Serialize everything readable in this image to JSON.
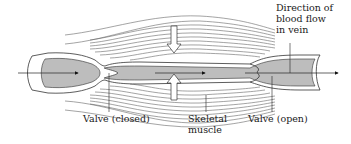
{
  "diagram": {
    "labels": {
      "direction": [
        "Direction of",
        "blood flow",
        "in vein"
      ],
      "valve_closed": "Valve (closed)",
      "skeletal_muscle": [
        "Skeletal",
        "muscle"
      ],
      "valve_open": "Valve (open)"
    },
    "colors": {
      "vein_fill": "#bdbdbd",
      "vein_wall": "#ffffff",
      "outline": "#333333",
      "muscle_lines": "#555555",
      "background": "#ffffff"
    }
  }
}
